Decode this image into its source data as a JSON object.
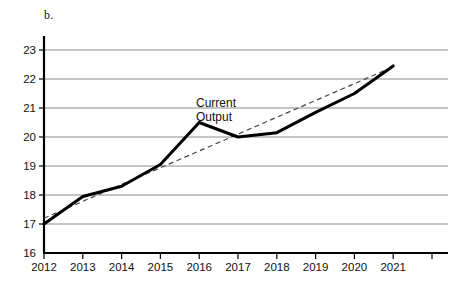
{
  "panel": {
    "label": "b."
  },
  "chart_data": {
    "type": "line",
    "title": "",
    "subtitle": "",
    "xlabel": "",
    "ylabel": "",
    "xlim": [
      2012,
      2021
    ],
    "ylim": [
      16,
      23
    ],
    "grid": "horizontal",
    "legend_position": "none",
    "x": [
      2012,
      2013,
      2014,
      2015,
      2016,
      2017,
      2018,
      2019,
      2020,
      2021
    ],
    "categories": [
      "2012",
      "2013",
      "2014",
      "2015",
      "2016",
      "2017",
      "2018",
      "2019",
      "2020",
      "2021"
    ],
    "y_ticks": [
      16,
      17,
      18,
      19,
      20,
      21,
      22,
      23
    ],
    "y_tick_labels": [
      "16",
      "17",
      "18",
      "19",
      "20",
      "21",
      "22",
      "23"
    ],
    "series": [
      {
        "name": "Current Output",
        "style": "solid",
        "color": "#000000",
        "values": [
          17.0,
          17.95,
          18.3,
          19.05,
          20.5,
          20.0,
          20.15,
          20.85,
          21.5,
          22.45
        ]
      },
      {
        "name": "Trend",
        "style": "dashed",
        "color": "#444444",
        "values": [
          17.2,
          17.78,
          18.36,
          18.94,
          19.52,
          20.1,
          20.68,
          21.26,
          21.84,
          22.42
        ]
      }
    ],
    "annotations": [
      {
        "text_line1": "Current",
        "text_line2": "Output",
        "x": 2016.1,
        "y": 21.0
      }
    ]
  },
  "axes": {
    "y_axis_name": "y-axis",
    "x_axis_name": "x-axis",
    "gridline_color": "#8c8c8c",
    "axis_color": "#000000"
  }
}
